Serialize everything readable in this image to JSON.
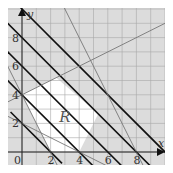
{
  "chart_data": {
    "type": "line",
    "title": "",
    "xlabel": "x",
    "ylabel": "y",
    "xlim": [
      -1,
      10
    ],
    "ylim": [
      -1,
      10
    ],
    "grid": true,
    "x_ticks": [
      "0",
      "2",
      "4",
      "6",
      "8"
    ],
    "y_ticks": [
      "2",
      "4",
      "6",
      "8"
    ],
    "region_label": "R",
    "region_fill_outside": "#dcdcdc",
    "region_fill_inside": "#ffffff",
    "feasible_region_vertices": [
      [
        0,
        4
      ],
      [
        2.4,
        5.2
      ],
      [
        5.33,
        2.67
      ],
      [
        4,
        0
      ],
      [
        2,
        0
      ]
    ],
    "lines": [
      {
        "name": "x+y=10",
        "style": "thick",
        "points": [
          [
            0,
            10
          ],
          [
            10,
            0
          ]
        ]
      },
      {
        "name": "x+y=6",
        "style": "thick",
        "points": [
          [
            0,
            6
          ],
          [
            6,
            0
          ]
        ]
      },
      {
        "name": "x+y=4",
        "style": "thick",
        "points": [
          [
            0,
            4
          ],
          [
            4,
            0
          ]
        ]
      },
      {
        "name": "x+y=2",
        "style": "thick",
        "points": [
          [
            0,
            2
          ],
          [
            2,
            0
          ]
        ]
      },
      {
        "name": "x+y=8",
        "style": "thick",
        "points": [
          [
            0,
            8
          ],
          [
            8,
            0
          ]
        ]
      },
      {
        "name": "2x+y=16",
        "style": "thin",
        "points": [
          [
            3,
            10
          ],
          [
            8,
            0
          ]
        ]
      },
      {
        "name": "x-2y=-8",
        "style": "thin",
        "points": [
          [
            0,
            4
          ],
          [
            10,
            9
          ]
        ]
      },
      {
        "name": "2x+y=4",
        "style": "thin",
        "points": [
          [
            -1,
            6
          ],
          [
            2.5,
            -1
          ]
        ]
      },
      {
        "name": "x+2y=4",
        "style": "thin",
        "points": [
          [
            -1,
            2.5
          ],
          [
            6,
            -1
          ]
        ]
      }
    ]
  },
  "labels": {
    "x_axis": "x",
    "y_axis": "y",
    "region": "R",
    "origin": "0"
  }
}
